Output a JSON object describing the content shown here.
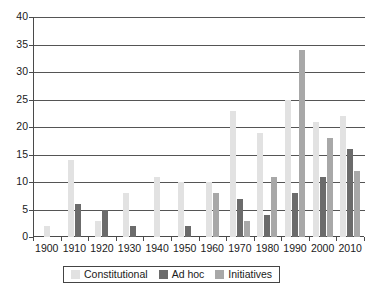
{
  "chart_data": {
    "type": "bar",
    "title": "",
    "xlabel": "",
    "ylabel": "",
    "ylim": [
      0,
      40
    ],
    "ytick_step": 5,
    "yticks": [
      0,
      5,
      10,
      15,
      20,
      25,
      30,
      35,
      40
    ],
    "grid": true,
    "legend_position": "bottom",
    "categories": [
      "1900",
      "1910",
      "1920",
      "1930",
      "1940",
      "1950",
      "1960",
      "1970",
      "1980",
      "1990",
      "2000",
      "2010"
    ],
    "series": [
      {
        "name": "Constitutional",
        "color": "#e2e2e2",
        "values": [
          2,
          14,
          3,
          8,
          11,
          10,
          10,
          23,
          19,
          25,
          21,
          22
        ]
      },
      {
        "name": "Ad hoc",
        "color": "#6b6b6b",
        "values": [
          0,
          6,
          5,
          2,
          0,
          2,
          0,
          7,
          4,
          8,
          11,
          16
        ]
      },
      {
        "name": "Initiatives",
        "color": "#a8a8a8",
        "values": [
          0,
          0,
          0,
          0,
          0,
          0,
          8,
          3,
          11,
          34,
          18,
          12
        ]
      }
    ]
  },
  "axis": {
    "y_tick_labels": [
      "0",
      "5",
      "10",
      "15",
      "20",
      "25",
      "30",
      "35",
      "40"
    ],
    "x_tick_labels": [
      "1900",
      "1910",
      "1920",
      "1930",
      "1940",
      "1950",
      "1960",
      "1970",
      "1980",
      "1990",
      "2000",
      "2010"
    ]
  },
  "legend": {
    "entries": [
      {
        "label": "Constitutional",
        "color": "#e2e2e2"
      },
      {
        "label": "Ad hoc",
        "color": "#6b6b6b"
      },
      {
        "label": "Initiatives",
        "color": "#a8a8a8"
      }
    ]
  }
}
